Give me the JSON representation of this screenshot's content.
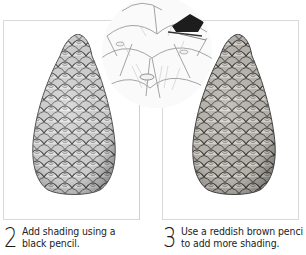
{
  "steps": [
    {
      "number": "2",
      "line1": "Add shading using a",
      "line2": "black pencil.",
      "illustration": "pine-cone-graphite-shaded"
    },
    {
      "number": "3",
      "line1": "Use a reddish brown penci",
      "line2": "to add more shading.",
      "illustration": "pine-cone-brown-shaded"
    }
  ],
  "detail": {
    "illustration": "magnified-cone-scales-with-pencil-tip"
  },
  "colors": {
    "frame_border": "#d9d9d9",
    "text": "#222222",
    "graphite_dark": "#3a3a3a",
    "graphite_mid": "#8a8a8a",
    "graphite_light": "#cfcfcf",
    "brown_tint": "#6e6a63"
  }
}
